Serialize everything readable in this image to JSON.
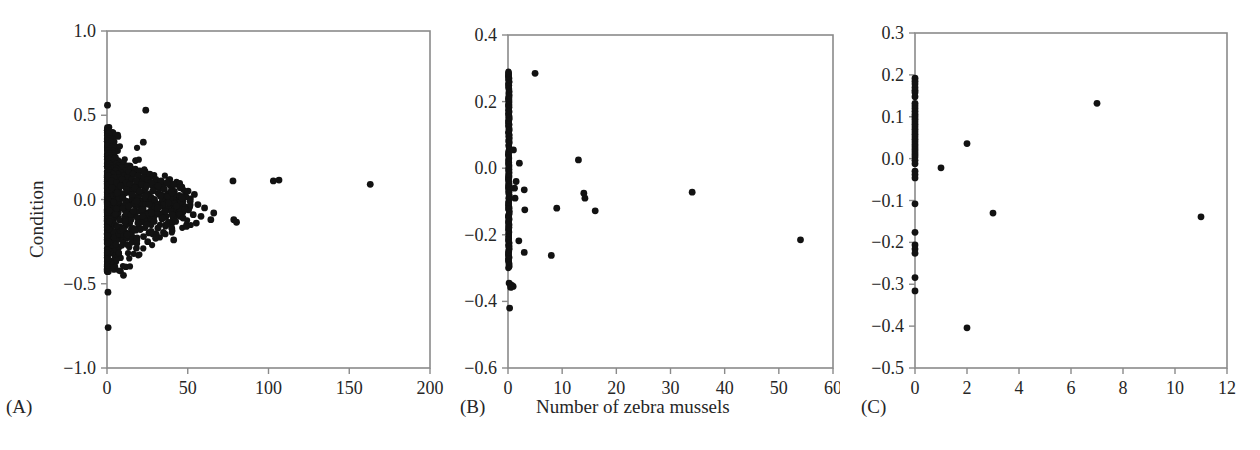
{
  "figure": {
    "background_color": "#ffffff",
    "point_color": "#121212",
    "axis_color": "#8a8a8a",
    "text_color": "#262626",
    "shared_x_label": "Number of zebra mussels",
    "shared_y_label": "Condition"
  },
  "chart_data": [
    {
      "type": "scatter",
      "panel": "A",
      "panel_label": "(A)",
      "title": "",
      "xlabel": "Number of zebra mussels",
      "ylabel": "Condition",
      "xlim": [
        0,
        200
      ],
      "ylim": [
        -1.0,
        1.0
      ],
      "xticks": [
        0,
        50,
        100,
        150,
        200
      ],
      "xtick_labels": [
        "0",
        "50",
        "100",
        "150",
        "200"
      ],
      "yticks": [
        -1.0,
        -0.5,
        0.0,
        0.5,
        1.0
      ],
      "ytick_labels": [
        "−1.0",
        "−0.5",
        "0.0",
        "0.5",
        "1.0"
      ],
      "grid": false,
      "legend": "none",
      "marker": "filled-circle",
      "n_points_approx": 900,
      "description": "Dense funnel-shaped cloud hugging x = 0, spread narrowing as mussel count increases; a few far-right outliers.",
      "points": [
        [
          0.3,
          0.56
        ],
        [
          0.5,
          0.42
        ],
        [
          0.8,
          0.41
        ],
        [
          1.1,
          0.39
        ],
        [
          0.4,
          0.37
        ],
        [
          1.6,
          0.36
        ],
        [
          0.9,
          0.35
        ],
        [
          2.1,
          0.34
        ],
        [
          1.3,
          0.33
        ],
        [
          0.6,
          0.32
        ],
        [
          2.6,
          0.31
        ],
        [
          1.8,
          0.3
        ],
        [
          3.2,
          0.29
        ],
        [
          0.7,
          0.29
        ],
        [
          2.2,
          0.28
        ],
        [
          4.1,
          0.27
        ],
        [
          1.5,
          0.27
        ],
        [
          3.5,
          0.26
        ],
        [
          0.9,
          0.26
        ],
        [
          2.8,
          0.25
        ],
        [
          5.2,
          0.25
        ],
        [
          1.2,
          0.24
        ],
        [
          4.4,
          0.24
        ],
        [
          6.8,
          0.23
        ],
        [
          2.4,
          0.23
        ],
        [
          3.9,
          0.22
        ],
        [
          8.1,
          0.22
        ],
        [
          1.7,
          0.21
        ],
        [
          5.6,
          0.21
        ],
        [
          10.3,
          0.21
        ],
        [
          2.9,
          0.2
        ],
        [
          7.2,
          0.2
        ],
        [
          12.4,
          0.2
        ],
        [
          4.6,
          0.19
        ],
        [
          0.8,
          0.19
        ],
        [
          9.1,
          0.19
        ],
        [
          14.2,
          0.18
        ],
        [
          3.3,
          0.18
        ],
        [
          6.1,
          0.18
        ],
        [
          17.5,
          0.18
        ],
        [
          1.4,
          0.17
        ],
        [
          11.2,
          0.17
        ],
        [
          20.3,
          0.17
        ],
        [
          5.1,
          0.17
        ],
        [
          8.6,
          0.16
        ],
        [
          23.1,
          0.16
        ],
        [
          2.2,
          0.16
        ],
        [
          13.4,
          0.16
        ],
        [
          26.5,
          0.15
        ],
        [
          6.7,
          0.15
        ],
        [
          16.2,
          0.15
        ],
        [
          3.8,
          0.15
        ],
        [
          10.1,
          0.14
        ],
        [
          28.4,
          0.14
        ],
        [
          19.3,
          0.14
        ],
        [
          1.1,
          0.14
        ],
        [
          7.4,
          0.13
        ],
        [
          22.8,
          0.13
        ],
        [
          12.6,
          0.13
        ],
        [
          4.3,
          0.13
        ],
        [
          30.2,
          0.12
        ],
        [
          15.5,
          0.12
        ],
        [
          9.2,
          0.12
        ],
        [
          25.1,
          0.12
        ],
        [
          2.7,
          0.11
        ],
        [
          18.1,
          0.11
        ],
        [
          33.5,
          0.11
        ],
        [
          78.0,
          0.11
        ],
        [
          103.0,
          0.11
        ],
        [
          106.5,
          0.115
        ],
        [
          11.8,
          0.1
        ],
        [
          27.2,
          0.1
        ],
        [
          37.1,
          0.1
        ],
        [
          5.9,
          0.1
        ],
        [
          163.0,
          0.09
        ],
        [
          21.4,
          0.09
        ],
        [
          14.3,
          0.09
        ],
        [
          41.2,
          0.09
        ],
        [
          8.3,
          0.08
        ],
        [
          31.6,
          0.08
        ],
        [
          24.5,
          0.08
        ],
        [
          45.3,
          0.07
        ],
        [
          17.2,
          0.07
        ],
        [
          3.1,
          0.07
        ],
        [
          35.4,
          0.06
        ],
        [
          12.1,
          0.06
        ],
        [
          50.2,
          0.05
        ],
        [
          28.3,
          0.05
        ],
        [
          20.1,
          0.05
        ],
        [
          6.4,
          0.04
        ],
        [
          40.2,
          0.04
        ],
        [
          54.1,
          0.03
        ],
        [
          15.8,
          0.03
        ],
        [
          33.1,
          0.02
        ],
        [
          23.6,
          0.02
        ],
        [
          46.3,
          0.01
        ],
        [
          9.7,
          0.01
        ],
        [
          29.4,
          0.0
        ],
        [
          51.5,
          -0.01
        ],
        [
          18.4,
          -0.01
        ],
        [
          38.2,
          -0.02
        ],
        [
          26.1,
          -0.03
        ],
        [
          56.3,
          -0.03
        ],
        [
          13.5,
          -0.04
        ],
        [
          43.1,
          -0.04
        ],
        [
          31.2,
          -0.05
        ],
        [
          60.4,
          -0.05
        ],
        [
          21.8,
          -0.06
        ],
        [
          48.2,
          -0.06
        ],
        [
          36.1,
          -0.07
        ],
        [
          16.3,
          -0.07
        ],
        [
          66.1,
          -0.08
        ],
        [
          27.5,
          -0.08
        ],
        [
          53.4,
          -0.09
        ],
        [
          40.3,
          -0.09
        ],
        [
          22.1,
          -0.1
        ],
        [
          58.2,
          -0.1
        ],
        [
          34.6,
          -0.11
        ],
        [
          47.1,
          -0.11
        ],
        [
          64.3,
          -0.12
        ],
        [
          78.5,
          -0.12
        ],
        [
          80.2,
          -0.135
        ],
        [
          29.2,
          -0.13
        ],
        [
          42.5,
          -0.13
        ],
        [
          19.1,
          -0.14
        ],
        [
          55.3,
          -0.14
        ],
        [
          36.4,
          -0.15
        ],
        [
          24.3,
          -0.15
        ],
        [
          49.2,
          -0.16
        ],
        [
          31.5,
          -0.17
        ],
        [
          40.1,
          -0.17
        ],
        [
          17.2,
          -0.18
        ],
        [
          27.3,
          -0.19
        ],
        [
          35.2,
          -0.2
        ],
        [
          12.4,
          -0.21
        ],
        [
          22.6,
          -0.22
        ],
        [
          30.1,
          -0.23
        ],
        [
          41.3,
          -0.24
        ],
        [
          18.5,
          -0.24
        ],
        [
          25.2,
          -0.25
        ],
        [
          10.2,
          -0.45
        ],
        [
          0.6,
          -0.55
        ],
        [
          0.7,
          -0.76
        ],
        [
          24.0,
          0.53
        ],
        [
          22.5,
          0.34
        ]
      ]
    },
    {
      "type": "scatter",
      "panel": "B",
      "panel_label": "(B)",
      "title": "",
      "xlabel": "Number of zebra mussels",
      "ylabel": "Condition",
      "xlim": [
        0,
        60
      ],
      "ylim": [
        -0.6,
        0.4
      ],
      "xticks": [
        0,
        10,
        20,
        30,
        40,
        50,
        60
      ],
      "xtick_labels": [
        "0",
        "10",
        "20",
        "30",
        "40",
        "50",
        "60"
      ],
      "yticks": [
        -0.6,
        -0.4,
        -0.2,
        0.0,
        0.2,
        0.4
      ],
      "ytick_labels": [
        "−0.6",
        "−0.4",
        "−0.2",
        "0.0",
        "0.2",
        "0.4"
      ],
      "grid": false,
      "legend": "none",
      "marker": "filled-circle",
      "description": "Solid vertical band of points at x ≈ 0 spanning −0.30 to 0.29, a cluster near −0.35, one point at −0.42, and about 15 scattered points out to x = 54.",
      "column_x": 0.15,
      "column_y_range": [
        -0.3,
        0.29
      ],
      "column_n": 260,
      "points": [
        [
          0.2,
          -0.345
        ],
        [
          0.45,
          -0.35
        ],
        [
          0.7,
          -0.352
        ],
        [
          0.95,
          -0.355
        ],
        [
          0.5,
          -0.358
        ],
        [
          0.3,
          -0.42
        ],
        [
          1.0,
          0.055
        ],
        [
          5.0,
          0.285
        ],
        [
          2.1,
          0.015
        ],
        [
          13.0,
          0.025
        ],
        [
          3.0,
          -0.065
        ],
        [
          3.1,
          -0.125
        ],
        [
          9.0,
          -0.12
        ],
        [
          14.0,
          -0.075
        ],
        [
          14.2,
          -0.09
        ],
        [
          16.1,
          -0.128
        ],
        [
          34.0,
          -0.072
        ],
        [
          54.0,
          -0.215
        ],
        [
          2.0,
          -0.218
        ],
        [
          3.0,
          -0.253
        ],
        [
          8.0,
          -0.262
        ],
        [
          1.3,
          -0.09
        ],
        [
          1.5,
          -0.04
        ],
        [
          1.2,
          -0.06
        ]
      ]
    },
    {
      "type": "scatter",
      "panel": "C",
      "panel_label": "(C)",
      "title": "",
      "xlabel": "Number of zebra mussels",
      "ylabel": "Condition",
      "xlim": [
        0,
        12
      ],
      "ylim": [
        -0.5,
        0.3
      ],
      "xticks": [
        0,
        2,
        4,
        6,
        8,
        10,
        12
      ],
      "xtick_labels": [
        "0",
        "2",
        "4",
        "6",
        "8",
        "10",
        "12"
      ],
      "yticks": [
        -0.5,
        -0.4,
        -0.3,
        -0.2,
        -0.1,
        0.0,
        0.1,
        0.2,
        0.3
      ],
      "ytick_labels": [
        "−0.5",
        "−0.4",
        "−0.3",
        "−0.2",
        "−0.1",
        "0.0",
        "0.1",
        "0.2",
        "0.3"
      ],
      "grid": false,
      "legend": "none",
      "marker": "filled-circle",
      "description": "Discrete column of roughly 45 points at x = 0 from 0.19 down to −0.32, plus six scattered points at x = 1, 2, 3, 7 and 11.",
      "points": [
        [
          0.0,
          0.192
        ],
        [
          0.0,
          0.185
        ],
        [
          0.0,
          0.178
        ],
        [
          0.0,
          0.17
        ],
        [
          0.0,
          0.163
        ],
        [
          0.0,
          0.158
        ],
        [
          0.0,
          0.148
        ],
        [
          0.0,
          0.132
        ],
        [
          0.0,
          0.126
        ],
        [
          0.0,
          0.12
        ],
        [
          0.0,
          0.113
        ],
        [
          0.0,
          0.106
        ],
        [
          0.0,
          0.1
        ],
        [
          0.0,
          0.094
        ],
        [
          0.0,
          0.088
        ],
        [
          0.0,
          0.082
        ],
        [
          0.0,
          0.076
        ],
        [
          0.0,
          0.07
        ],
        [
          0.0,
          0.064
        ],
        [
          0.0,
          0.058
        ],
        [
          0.0,
          0.052
        ],
        [
          0.0,
          0.046
        ],
        [
          0.0,
          0.04
        ],
        [
          0.0,
          0.034
        ],
        [
          0.0,
          0.028
        ],
        [
          0.0,
          0.022
        ],
        [
          0.0,
          0.016
        ],
        [
          0.0,
          0.01
        ],
        [
          0.0,
          0.004
        ],
        [
          0.0,
          -0.004
        ],
        [
          0.0,
          -0.012
        ],
        [
          0.0,
          -0.03
        ],
        [
          0.0,
          -0.038
        ],
        [
          0.0,
          -0.046
        ],
        [
          0.0,
          -0.108
        ],
        [
          0.0,
          -0.176
        ],
        [
          0.0,
          -0.206
        ],
        [
          0.0,
          -0.216
        ],
        [
          0.0,
          -0.226
        ],
        [
          0.0,
          -0.284
        ],
        [
          0.0,
          -0.316
        ],
        [
          1.0,
          -0.022
        ],
        [
          2.0,
          0.036
        ],
        [
          2.0,
          -0.404
        ],
        [
          3.0,
          -0.13
        ],
        [
          7.0,
          0.132
        ],
        [
          11.0,
          -0.139
        ]
      ]
    }
  ]
}
